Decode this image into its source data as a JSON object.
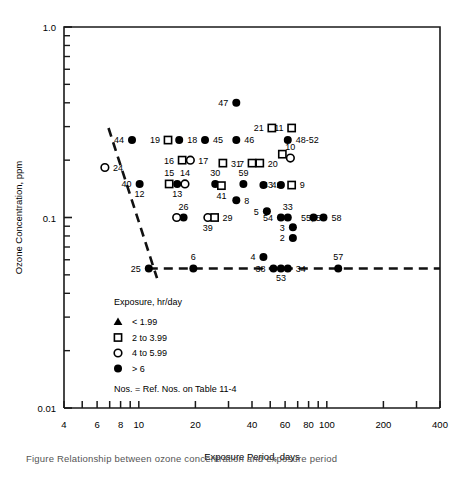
{
  "figure": {
    "caption": "Figure    Relationship between ozone concentration and exposure period"
  },
  "chart_data": {
    "type": "scatter",
    "title": "",
    "xlabel": "Exposure Period, days",
    "ylabel": "Ozone Concentration, ppm",
    "xscale": "log",
    "yscale": "log",
    "xlim": [
      4,
      400
    ],
    "ylim": [
      0.01,
      1.0
    ],
    "xticks": [
      4,
      6,
      8,
      10,
      20,
      40,
      60,
      80,
      100,
      200,
      400
    ],
    "xticklabels": [
      "4",
      "6",
      "8",
      "10",
      "20",
      "40",
      "60",
      "80",
      "100",
      "200",
      "400"
    ],
    "yticks": [
      0.01,
      0.1,
      1.0
    ],
    "yticklabels": [
      "0.01",
      "0.1",
      "1.0"
    ],
    "grid": false,
    "legend": {
      "title": "Exposure, hr/day",
      "position": "lower-left-inside",
      "entries": [
        {
          "marker": "triangle",
          "label": "< 1.99"
        },
        {
          "marker": "square",
          "label": "2 to 3.99"
        },
        {
          "marker": "open-circle",
          "label": "4 to 5.99"
        },
        {
          "marker": "filled-circle",
          "label": "> 6"
        }
      ],
      "note": "Nos. = Ref. Nos. on Table 11-4"
    },
    "points": [
      {
        "ref": "47",
        "x": 33,
        "y": 0.4,
        "marker": "filled-circle",
        "lab": "left"
      },
      {
        "ref": "21",
        "x": 51,
        "y": 0.295,
        "marker": "square",
        "lab": "left"
      },
      {
        "ref": "11",
        "x": 65,
        "y": 0.295,
        "marker": "square",
        "lab": "left"
      },
      {
        "ref": "44",
        "x": 9.2,
        "y": 0.255,
        "marker": "filled-circle",
        "lab": "left"
      },
      {
        "ref": "19",
        "x": 14.3,
        "y": 0.255,
        "marker": "square",
        "lab": "left"
      },
      {
        "ref": "18",
        "x": 16.4,
        "y": 0.255,
        "marker": "filled-circle",
        "lab": "right"
      },
      {
        "ref": "45",
        "x": 22.5,
        "y": 0.255,
        "marker": "filled-circle",
        "lab": "right"
      },
      {
        "ref": "46",
        "x": 33,
        "y": 0.255,
        "marker": "filled-circle",
        "lab": "right"
      },
      {
        "ref": "48-52",
        "x": 62,
        "y": 0.255,
        "marker": "filled-circle",
        "lab": "right"
      },
      {
        "ref": "10",
        "x": 64,
        "y": 0.205,
        "marker": "open-circle",
        "lab": "above"
      },
      {
        "ref": "",
        "x": 58,
        "y": 0.215,
        "marker": "square",
        "lab": "none"
      },
      {
        "ref": "24",
        "x": 6.6,
        "y": 0.183,
        "marker": "open-circle",
        "lab": "right"
      },
      {
        "ref": "16",
        "x": 17.0,
        "y": 0.2,
        "marker": "square",
        "lab": "left"
      },
      {
        "ref": "17",
        "x": 18.8,
        "y": 0.2,
        "marker": "open-circle",
        "lab": "right"
      },
      {
        "ref": "31",
        "x": 28,
        "y": 0.193,
        "marker": "square",
        "lab": "right"
      },
      {
        "ref": "7",
        "x": 40,
        "y": 0.193,
        "marker": "square",
        "lab": "left"
      },
      {
        "ref": "20",
        "x": 44,
        "y": 0.193,
        "marker": "square",
        "lab": "right"
      },
      {
        "ref": "40",
        "x": 10.1,
        "y": 0.15,
        "marker": "filled-circle",
        "lab": "left"
      },
      {
        "ref": "12",
        "x": 10.1,
        "y": 0.15,
        "marker": "none",
        "lab": "below"
      },
      {
        "ref": "15",
        "x": 14.5,
        "y": 0.15,
        "marker": "square",
        "lab": "above"
      },
      {
        "ref": "13",
        "x": 16.0,
        "y": 0.15,
        "marker": "filled-circle",
        "lab": "below"
      },
      {
        "ref": "14",
        "x": 17.6,
        "y": 0.15,
        "marker": "open-circle",
        "lab": "above"
      },
      {
        "ref": "30",
        "x": 25.5,
        "y": 0.15,
        "marker": "filled-circle",
        "lab": "above"
      },
      {
        "ref": "41",
        "x": 27.5,
        "y": 0.147,
        "marker": "square",
        "lab": "below"
      },
      {
        "ref": "59",
        "x": 36,
        "y": 0.15,
        "marker": "filled-circle",
        "lab": "above"
      },
      {
        "ref": "42",
        "x": 46,
        "y": 0.148,
        "marker": "filled-circle",
        "lab": "right"
      },
      {
        "ref": "43",
        "x": 57,
        "y": 0.148,
        "marker": "filled-circle",
        "lab": "left"
      },
      {
        "ref": "9",
        "x": 65,
        "y": 0.148,
        "marker": "square",
        "lab": "right"
      },
      {
        "ref": "8",
        "x": 33,
        "y": 0.123,
        "marker": "filled-circle",
        "lab": "right"
      },
      {
        "ref": "26",
        "x": 17.3,
        "y": 0.1,
        "marker": "filled-circle",
        "lab": "above"
      },
      {
        "ref": "",
        "x": 15.9,
        "y": 0.1,
        "marker": "open-circle",
        "lab": "none"
      },
      {
        "ref": "39",
        "x": 23.3,
        "y": 0.1,
        "marker": "open-circle",
        "lab": "below"
      },
      {
        "ref": "29",
        "x": 25.3,
        "y": 0.1,
        "marker": "square",
        "lab": "right"
      },
      {
        "ref": "5",
        "x": 48,
        "y": 0.108,
        "marker": "filled-circle",
        "lab": "left"
      },
      {
        "ref": "33",
        "x": 62,
        "y": 0.1,
        "marker": "filled-circle",
        "lab": "above"
      },
      {
        "ref": "54",
        "x": 57,
        "y": 0.1,
        "marker": "filled-circle",
        "lab": "left"
      },
      {
        "ref": "55, 56",
        "x": 66,
        "y": 0.1,
        "marker": "none",
        "lab": "right"
      },
      {
        "ref": "",
        "x": 85,
        "y": 0.1,
        "marker": "filled-circle",
        "lab": "none"
      },
      {
        "ref": "58",
        "x": 96,
        "y": 0.1,
        "marker": "filled-circle",
        "lab": "right"
      },
      {
        "ref": "3",
        "x": 66,
        "y": 0.089,
        "marker": "filled-circle",
        "lab": "left"
      },
      {
        "ref": "2",
        "x": 66,
        "y": 0.078,
        "marker": "filled-circle",
        "lab": "left"
      },
      {
        "ref": "4",
        "x": 46,
        "y": 0.062,
        "marker": "filled-circle",
        "lab": "left"
      },
      {
        "ref": "25",
        "x": 11.3,
        "y": 0.054,
        "marker": "filled-circle",
        "lab": "left"
      },
      {
        "ref": "6",
        "x": 19.5,
        "y": 0.054,
        "marker": "filled-circle",
        "lab": "above"
      },
      {
        "ref": "38",
        "x": 52,
        "y": 0.054,
        "marker": "filled-circle",
        "lab": "left"
      },
      {
        "ref": "53",
        "x": 57,
        "y": 0.054,
        "marker": "filled-circle",
        "lab": "below"
      },
      {
        "ref": "",
        "x": 62,
        "y": 0.054,
        "marker": "filled-circle",
        "lab": "none"
      },
      {
        "ref": "34",
        "x": 62,
        "y": 0.054,
        "marker": "none",
        "lab": "right"
      },
      {
        "ref": "57",
        "x": 115,
        "y": 0.054,
        "marker": "filled-circle",
        "lab": "above"
      }
    ],
    "trend_lines": [
      {
        "name": "sloped-threshold-line",
        "style": "dashed",
        "points": [
          [
            6.9,
            0.295
          ],
          [
            12.5,
            0.048
          ]
        ]
      },
      {
        "name": "horizontal-threshold-line",
        "style": "dashed",
        "points": [
          [
            11.3,
            0.054
          ],
          [
            400,
            0.054
          ]
        ]
      }
    ]
  }
}
